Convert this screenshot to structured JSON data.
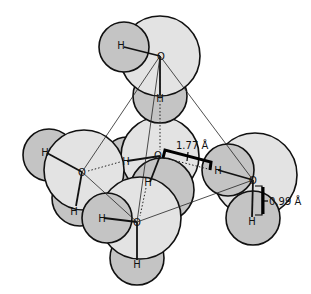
{
  "figure": {
    "atom_labels": {
      "oxygen": "O",
      "hydrogen": "H"
    },
    "measurements": {
      "hydrogen_bond_length": "1.77 Å",
      "covalent_bond_length": "0.99 Å"
    },
    "molecules": [
      {
        "id": "top",
        "o": [
          160,
          56
        ],
        "h": [
          [
            124,
            47
          ],
          [
            160,
            99
          ]
        ]
      },
      {
        "id": "center",
        "o": [
          160,
          156
        ],
        "h": [
          [
            127,
            161
          ],
          [
            148,
            182
          ]
        ]
      },
      {
        "id": "left",
        "o": [
          82,
          172
        ],
        "h": [
          [
            46,
            153
          ],
          [
            76,
            208
          ]
        ]
      },
      {
        "id": "right",
        "o": [
          253,
          180
        ],
        "h": [
          [
            218,
            170
          ],
          [
            252,
            221
          ]
        ]
      },
      {
        "id": "bottom",
        "o": [
          137,
          222
        ],
        "h": [
          [
            102,
            218
          ],
          [
            137,
            264
          ]
        ]
      }
    ],
    "colors": {
      "oxygen_fill": "#e3e3e3",
      "hydrogen_fill": "#c4c4c4",
      "outline": "#111111"
    }
  }
}
